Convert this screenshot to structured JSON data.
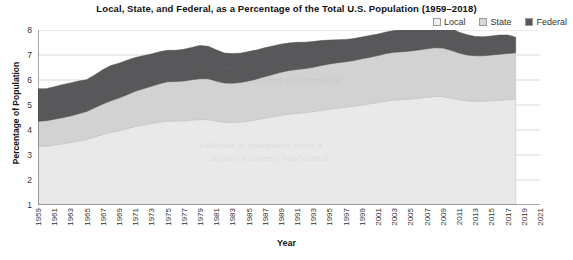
{
  "chart_data": {
    "type": "area",
    "stacked": true,
    "title": "Local, State, and Federal, as a Percentage of the Total U.S. Population (1959–2018)",
    "xlabel": "Year",
    "ylabel": "Percentage of Population",
    "xlim": [
      1959,
      2021
    ],
    "ylim": [
      1,
      8
    ],
    "grid": true,
    "legend_position": "top-right",
    "y_ticks": [
      1,
      2,
      3,
      4,
      5,
      6,
      7,
      8
    ],
    "x_ticks": [
      1959,
      1961,
      1963,
      1965,
      1967,
      1969,
      1971,
      1973,
      1975,
      1977,
      1979,
      1981,
      1983,
      1985,
      1987,
      1989,
      1991,
      1993,
      1995,
      1997,
      1999,
      2001,
      2003,
      2005,
      2007,
      2009,
      2011,
      2013,
      2015,
      2017,
      2019,
      2021
    ],
    "x": [
      1959,
      1960,
      1961,
      1962,
      1963,
      1964,
      1965,
      1966,
      1967,
      1968,
      1969,
      1970,
      1971,
      1972,
      1973,
      1974,
      1975,
      1976,
      1977,
      1978,
      1979,
      1980,
      1981,
      1982,
      1983,
      1984,
      1985,
      1986,
      1987,
      1988,
      1989,
      1990,
      1991,
      1992,
      1993,
      1994,
      1995,
      1996,
      1997,
      1998,
      1999,
      2000,
      2001,
      2002,
      2003,
      2004,
      2005,
      2006,
      2007,
      2008,
      2009,
      2010,
      2011,
      2012,
      2013,
      2014,
      2015,
      2016,
      2017,
      2018
    ],
    "series": [
      {
        "name": "Local",
        "color": "#e9e9e9",
        "values": [
          2.35,
          2.36,
          2.4,
          2.45,
          2.5,
          2.56,
          2.62,
          2.72,
          2.82,
          2.9,
          2.97,
          3.05,
          3.14,
          3.2,
          3.26,
          3.32,
          3.36,
          3.36,
          3.37,
          3.4,
          3.42,
          3.42,
          3.36,
          3.31,
          3.3,
          3.32,
          3.36,
          3.41,
          3.47,
          3.53,
          3.59,
          3.64,
          3.67,
          3.7,
          3.74,
          3.79,
          3.84,
          3.88,
          3.91,
          3.95,
          4.0,
          4.05,
          4.1,
          4.16,
          4.2,
          4.22,
          4.24,
          4.27,
          4.31,
          4.34,
          4.34,
          4.28,
          4.21,
          4.16,
          4.15,
          4.15,
          4.17,
          4.19,
          4.21,
          4.23
        ]
      },
      {
        "name": "State",
        "color": "#d2d2d2",
        "values": [
          1.0,
          1.01,
          1.03,
          1.04,
          1.06,
          1.09,
          1.12,
          1.17,
          1.22,
          1.27,
          1.31,
          1.36,
          1.41,
          1.45,
          1.49,
          1.53,
          1.57,
          1.58,
          1.59,
          1.61,
          1.63,
          1.63,
          1.6,
          1.57,
          1.57,
          1.58,
          1.6,
          1.63,
          1.66,
          1.69,
          1.72,
          1.74,
          1.75,
          1.76,
          1.77,
          1.79,
          1.8,
          1.81,
          1.82,
          1.83,
          1.85,
          1.86,
          1.88,
          1.9,
          1.91,
          1.91,
          1.92,
          1.93,
          1.94,
          1.95,
          1.94,
          1.91,
          1.87,
          1.84,
          1.82,
          1.82,
          1.83,
          1.84,
          1.85,
          1.86
        ]
      },
      {
        "name": "Federal",
        "color": "#58585a",
        "values": [
          1.3,
          1.29,
          1.31,
          1.33,
          1.33,
          1.31,
          1.28,
          1.32,
          1.38,
          1.4,
          1.38,
          1.37,
          1.34,
          1.31,
          1.28,
          1.27,
          1.27,
          1.26,
          1.27,
          1.3,
          1.33,
          1.31,
          1.26,
          1.21,
          1.18,
          1.17,
          1.17,
          1.16,
          1.15,
          1.13,
          1.12,
          1.11,
          1.09,
          1.06,
          1.03,
          1.0,
          0.96,
          0.92,
          0.89,
          0.87,
          0.86,
          0.87,
          0.85,
          0.85,
          0.86,
          0.86,
          0.85,
          0.84,
          0.83,
          0.84,
          0.87,
          0.88,
          0.84,
          0.8,
          0.76,
          0.75,
          0.75,
          0.76,
          0.73,
          0.61
        ]
      }
    ],
    "totals": [
      4.65,
      4.66,
      4.74,
      4.82,
      4.89,
      4.96,
      5.02,
      5.21,
      5.42,
      5.57,
      5.66,
      5.78,
      5.89,
      5.96,
      6.03,
      6.12,
      6.2,
      6.2,
      6.23,
      6.31,
      6.38,
      6.36,
      6.22,
      6.09,
      6.05,
      6.07,
      6.13,
      6.2,
      6.28,
      6.35,
      6.43,
      6.49,
      6.51,
      6.52,
      6.54,
      6.58,
      6.6,
      6.61,
      6.62,
      6.65,
      6.71,
      6.78,
      6.83,
      6.91,
      6.97,
      6.99,
      7.01,
      7.04,
      7.08,
      7.13,
      7.15,
      7.07,
      6.92,
      6.8,
      6.73,
      6.72,
      6.75,
      6.79,
      6.79,
      6.7
    ]
  },
  "legend": {
    "items": [
      {
        "label": "Local",
        "color": "#f2f2f2"
      },
      {
        "label": "State",
        "color": "#d8d8d8"
      },
      {
        "label": "Federal",
        "color": "#58585a"
      }
    ]
  },
  "axes": {
    "y_title": "Percentage of Population",
    "x_title": "Year",
    "y_tick_labels": [
      "8",
      "7",
      "6",
      "5",
      "4",
      "3",
      "2",
      "1"
    ],
    "x_tick_labels": [
      "1959",
      "1961",
      "1963",
      "1965",
      "1967",
      "1969",
      "1971",
      "1973",
      "1975",
      "1977",
      "1979",
      "1981",
      "1983",
      "1985",
      "1987",
      "1989",
      "1991",
      "1993",
      "1995",
      "1997",
      "1999",
      "2001",
      "2003",
      "2005",
      "2007",
      "2009",
      "2011",
      "2013",
      "2015",
      "2017",
      "2019",
      "2021"
    ]
  },
  "title": {
    "text": "Local, State, and Federal, as a Percentage of the Total U.S. Population (1959–2018)"
  },
  "ghost_text": {
    "lines": [
      "the time and effort required to",
      "prepare and submit the information",
      "collection of information unless it",
      "displays a currently valid control"
    ]
  }
}
